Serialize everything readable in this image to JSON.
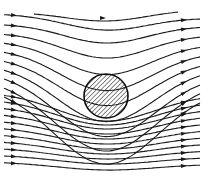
{
  "diagram": {
    "title": "",
    "colors": {
      "background": "#ffffff",
      "line": "#1a1a1a",
      "hatch": "#222222"
    },
    "cylinder": {
      "cx": 106,
      "cy": 96,
      "r": 22,
      "fill": "hatched"
    },
    "flow_direction": "left-to-right",
    "streamlines": {
      "upper": [
        {
          "y_left": 12,
          "y_right": 10,
          "dip": 10,
          "x_start": 34,
          "x_end": 178
        },
        {
          "y_left": 14,
          "y_right": 18,
          "dip": 14,
          "x_start": 4,
          "x_end": 200
        },
        {
          "y_left": 24,
          "y_right": 26,
          "dip": 18,
          "x_start": 4,
          "x_end": 200
        },
        {
          "y_left": 33,
          "y_right": 35,
          "dip": 24,
          "x_start": 4,
          "x_end": 200
        },
        {
          "y_left": 41,
          "y_right": 44,
          "dip": 32,
          "x_start": 4,
          "x_end": 200
        },
        {
          "y_left": 49,
          "y_right": 52,
          "dip": 40,
          "x_start": 4,
          "x_end": 200
        },
        {
          "y_left": 57,
          "y_right": 60,
          "dip": 47,
          "x_start": 4,
          "x_end": 200
        },
        {
          "y_left": 64,
          "y_right": 67,
          "dip": 56,
          "x_start": 4,
          "x_end": 200
        },
        {
          "y_left": 71,
          "y_right": 74,
          "dip": 64,
          "x_start": 4,
          "x_end": 200
        },
        {
          "y_left": 78,
          "y_right": 80,
          "dip": 72,
          "x_start": 4,
          "x_end": 200
        },
        {
          "y_left": 85,
          "y_right": 87,
          "dip": 78,
          "x_start": 4,
          "x_end": 200
        }
      ],
      "lower": [
        {
          "y_left": 92,
          "y_right": 94,
          "dip": 28,
          "x_start": 4,
          "x_end": 200
        },
        {
          "y_left": 99,
          "y_right": 101,
          "dip": 25,
          "x_start": 4,
          "x_end": 200
        },
        {
          "y_left": 106,
          "y_right": 108,
          "dip": 22,
          "x_start": 4,
          "x_end": 200
        },
        {
          "y_left": 113,
          "y_right": 115,
          "dip": 20,
          "x_start": 4,
          "x_end": 200
        },
        {
          "y_left": 120,
          "y_right": 122,
          "dip": 18,
          "x_start": 4,
          "x_end": 200
        },
        {
          "y_left": 127,
          "y_right": 129,
          "dip": 16,
          "x_start": 4,
          "x_end": 200
        },
        {
          "y_left": 134,
          "y_right": 136,
          "dip": 14,
          "x_start": 4,
          "x_end": 200
        },
        {
          "y_left": 141,
          "y_right": 143,
          "dip": 12,
          "x_start": 4,
          "x_end": 200
        },
        {
          "y_left": 148,
          "y_right": 150,
          "dip": 10,
          "x_start": 4,
          "x_end": 200
        },
        {
          "y_left": 155,
          "y_right": 157,
          "dip": 8,
          "x_start": 4,
          "x_end": 200
        },
        {
          "y_left": 162,
          "y_right": 164,
          "dip": 7,
          "x_start": 4,
          "x_end": 200
        }
      ]
    },
    "arrows": {
      "top_arrow": {
        "x": 103,
        "y": 18
      },
      "left_column_x": 14,
      "right_column_x": 184
    }
  }
}
